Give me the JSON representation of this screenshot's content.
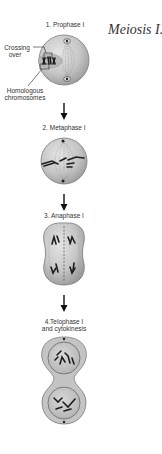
{
  "title": "Meiosis I.",
  "stages": [
    {
      "label": "1. Prophase I"
    },
    {
      "label": "2. Metaphase I"
    },
    {
      "label": "3. Anaphase I"
    },
    {
      "label_line1": "4.Telophase I",
      "label_line2": "and cytokinesis"
    }
  ],
  "annotations": {
    "crossing_over_line1": "Crossing",
    "crossing_over_line2": "over",
    "homologous_line1": "Homologous",
    "homologous_line2": "chromosomes"
  },
  "colors": {
    "cell_fill": "#c9c9c9",
    "cell_edge": "#7a7a7a",
    "chromosome": "#1e1e1e",
    "text": "#333333"
  }
}
